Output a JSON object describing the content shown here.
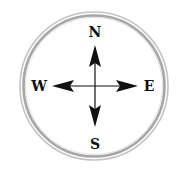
{
  "compass": {
    "labels": {
      "north": "N",
      "south": "S",
      "east": "E",
      "west": "W"
    },
    "colors": {
      "ring_outer": "#b8b8b8",
      "ring_inner": "#a0a0a0",
      "arrows": "#111111",
      "background": "#ffffff"
    }
  }
}
